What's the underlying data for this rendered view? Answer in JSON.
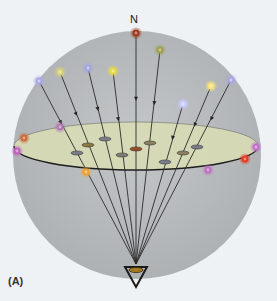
{
  "figure": {
    "north_label": "N",
    "panel_label": "(A)",
    "colors": {
      "background": "#eef2f5",
      "sphere": "#b9bcbf",
      "disk_fill": "#d8dcb4",
      "disk_stroke": "#222222",
      "line": "#2a2a2a"
    },
    "observer": {
      "x": 136,
      "y": 264
    },
    "sphere": {
      "cx": 137,
      "cy": 155,
      "r": 124
    },
    "disk": {
      "cx": 136,
      "cy": 146,
      "rx": 122,
      "ry": 24
    },
    "stars": [
      {
        "name": "north-star",
        "x": 136,
        "y": 33,
        "color": "#9c3a1c"
      },
      {
        "name": "star-olive",
        "x": 160,
        "y": 50,
        "color": "#9ea050"
      },
      {
        "name": "star-lavender-left",
        "x": 39,
        "y": 81,
        "color": "#a9a8e6"
      },
      {
        "name": "star-pale-yellow",
        "x": 60,
        "y": 72,
        "color": "#d8d27a"
      },
      {
        "name": "star-blue-lavender",
        "x": 88,
        "y": 68,
        "color": "#a3a6df"
      },
      {
        "name": "star-yellow",
        "x": 113,
        "y": 71,
        "color": "#e8dc40"
      },
      {
        "name": "star-bright-yellow",
        "x": 211,
        "y": 86,
        "color": "#f5e27a"
      },
      {
        "name": "star-lavender-right",
        "x": 231,
        "y": 80,
        "color": "#a8a6e0"
      },
      {
        "name": "star-light-blue",
        "x": 183,
        "y": 104,
        "color": "#c8ccff"
      }
    ],
    "edge_points": [
      {
        "name": "edge-orange-left",
        "x": 24,
        "y": 138,
        "color": "#cc6a3a"
      },
      {
        "name": "edge-magenta-left",
        "x": 17,
        "y": 151,
        "color": "#c060c0"
      },
      {
        "name": "edge-mauve",
        "x": 60,
        "y": 127,
        "color": "#b27ab0"
      },
      {
        "name": "edge-orange-front",
        "x": 86,
        "y": 172,
        "color": "#f0a030"
      },
      {
        "name": "edge-pink-front",
        "x": 208,
        "y": 170,
        "color": "#c070c0"
      },
      {
        "name": "edge-red-right",
        "x": 245,
        "y": 159,
        "color": "#e83a20"
      },
      {
        "name": "edge-pink-right",
        "x": 256,
        "y": 147,
        "color": "#c070c8"
      }
    ],
    "disk_marks": [
      {
        "x": 77,
        "y": 153,
        "color": "#7a7d88"
      },
      {
        "x": 88,
        "y": 145,
        "color": "#8a7a40"
      },
      {
        "x": 105,
        "y": 139,
        "color": "#7c7f8a"
      },
      {
        "x": 122,
        "y": 155,
        "color": "#7a7d70"
      },
      {
        "x": 136,
        "y": 149,
        "color": "#9a4a28"
      },
      {
        "x": 150,
        "y": 143,
        "color": "#8a8060"
      },
      {
        "x": 165,
        "y": 162,
        "color": "#7a7d8a"
      },
      {
        "x": 183,
        "y": 153,
        "color": "#8a8060"
      },
      {
        "x": 197,
        "y": 147,
        "color": "#7a7d88"
      }
    ],
    "rays_from_stars": [
      {
        "from": 0,
        "to_mark": 4
      },
      {
        "from": 1,
        "to_mark": 5
      },
      {
        "from": 2,
        "to_mark": 0
      },
      {
        "from": 3,
        "to_mark": 1
      },
      {
        "from": 4,
        "to_mark": 2
      },
      {
        "from": 5,
        "to_mark": 3
      },
      {
        "from": 6,
        "to_mark": 7
      },
      {
        "from": 7,
        "to_mark": 8
      },
      {
        "from": 8,
        "to_mark": 6
      }
    ]
  }
}
